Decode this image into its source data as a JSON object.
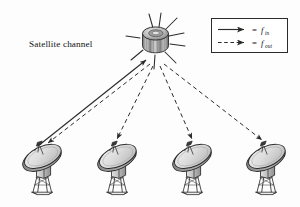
{
  "figure": {
    "title_label": "Satellite channel",
    "background_color": "#fdfdfd",
    "width": 300,
    "height": 207
  },
  "satellite": {
    "name": "communications-satellite",
    "body_shape": "cylinder",
    "antenna_spikes": 9,
    "position": {
      "x": 155,
      "y": 40
    },
    "body_color": "#8e8e8e",
    "body_dark": "#4a4a4a",
    "body_light": "#d8d8d8"
  },
  "legend": {
    "box_color": "#2b2b2b",
    "entries": [
      {
        "id": "uplink",
        "line_style": "solid",
        "equals": "=",
        "symbol": "f",
        "subscript": "in",
        "full_label": "= f_in",
        "color": "#2b2b2b"
      },
      {
        "id": "downlink",
        "line_style": "dashed",
        "equals": "=",
        "symbol": "f",
        "subscript": "out",
        "full_label": "= f_out",
        "color": "#2b2b2b"
      }
    ]
  },
  "ground_stations": [
    {
      "id": "station-1",
      "label": "",
      "x": 42,
      "y": 170
    },
    {
      "id": "station-2",
      "label": "",
      "x": 117,
      "y": 170
    },
    {
      "id": "station-3",
      "label": "",
      "x": 192,
      "y": 170
    },
    {
      "id": "station-4",
      "label": "",
      "x": 266,
      "y": 170
    }
  ],
  "links": [
    {
      "id": "link-uplink-1",
      "from": "station-1",
      "to": "satellite",
      "style": "solid",
      "direction": "up",
      "signal": "f_in"
    },
    {
      "id": "link-downlink-1",
      "from": "satellite",
      "to": "station-1",
      "style": "dashed",
      "direction": "down",
      "signal": "f_out"
    },
    {
      "id": "link-downlink-2",
      "from": "satellite",
      "to": "station-2",
      "style": "dashed",
      "direction": "down",
      "signal": "f_out"
    },
    {
      "id": "link-downlink-3",
      "from": "satellite",
      "to": "station-3",
      "style": "dashed",
      "direction": "down",
      "signal": "f_out"
    },
    {
      "id": "link-downlink-4",
      "from": "satellite",
      "to": "station-4",
      "style": "dashed",
      "direction": "down",
      "signal": "f_out"
    }
  ],
  "palette": {
    "stroke": "#2b2b2b",
    "dish_face": "#d5d5d5",
    "dish_rim": "#3a3a3a",
    "dish_back": "#9a9a9a",
    "tower": "#bdbdbd",
    "tower_dark": "#858585"
  }
}
